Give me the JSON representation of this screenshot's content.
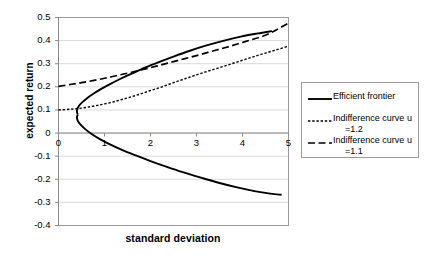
{
  "chart_data": {
    "type": "line",
    "title": "",
    "xlabel": "standard deviation",
    "ylabel": "expected return",
    "xlim": [
      0,
      5
    ],
    "ylim": [
      -0.4,
      0.5
    ],
    "xticks": [
      "0",
      "1",
      "2",
      "3",
      "4",
      "5"
    ],
    "yticks": [
      "0.5",
      "0.4",
      "0.3",
      "0.2",
      "0.1",
      "0",
      "-0.1",
      "-0.2",
      "-0.3",
      "-0.4"
    ],
    "grid": "horizontal",
    "legend_position": "right",
    "series": [
      {
        "name": "Efficient frontier",
        "style": "solid",
        "color": "#000000",
        "width": 1.9,
        "comment": "minimum-variance parabola opening to the right; vertex near (0.4, 0.08)",
        "points": [
          [
            0.42,
            0.08
          ],
          [
            0.4,
            0.092
          ],
          [
            0.41,
            0.104
          ],
          [
            0.45,
            0.119
          ],
          [
            0.52,
            0.134
          ],
          [
            0.62,
            0.151
          ],
          [
            0.75,
            0.169
          ],
          [
            0.92,
            0.19
          ],
          [
            1.12,
            0.212
          ],
          [
            1.35,
            0.235
          ],
          [
            1.6,
            0.258
          ],
          [
            1.88,
            0.283
          ],
          [
            2.18,
            0.307
          ],
          [
            2.5,
            0.331
          ],
          [
            2.84,
            0.355
          ],
          [
            3.2,
            0.378
          ],
          [
            3.58,
            0.399
          ],
          [
            3.96,
            0.417
          ],
          [
            4.3,
            0.43
          ],
          [
            4.52,
            0.437
          ],
          [
            4.64,
            0.441
          ]
        ],
        "lower_branch": [
          [
            0.42,
            0.08
          ],
          [
            0.4,
            0.068
          ],
          [
            0.42,
            0.053
          ],
          [
            0.48,
            0.036
          ],
          [
            0.58,
            0.017
          ],
          [
            0.72,
            -0.004
          ],
          [
            0.9,
            -0.026
          ],
          [
            1.12,
            -0.049
          ],
          [
            1.38,
            -0.073
          ],
          [
            1.68,
            -0.097
          ],
          [
            2.0,
            -0.121
          ],
          [
            2.34,
            -0.145
          ],
          [
            2.7,
            -0.169
          ],
          [
            3.08,
            -0.192
          ],
          [
            3.46,
            -0.214
          ],
          [
            3.86,
            -0.234
          ],
          [
            4.26,
            -0.251
          ],
          [
            4.6,
            -0.262
          ],
          [
            4.85,
            -0.267
          ]
        ]
      },
      {
        "name": "Indifference curve u =1.2",
        "label_line1": "Indifference curve u",
        "label_line2": "=1.2",
        "style": "dotted",
        "color": "#000000",
        "width": 1.4,
        "points": [
          [
            0.0,
            0.1
          ],
          [
            0.25,
            0.103
          ],
          [
            0.5,
            0.108
          ],
          [
            0.75,
            0.116
          ],
          [
            1.0,
            0.126
          ],
          [
            1.25,
            0.138
          ],
          [
            1.5,
            0.152
          ],
          [
            1.75,
            0.167
          ],
          [
            2.0,
            0.184
          ],
          [
            2.25,
            0.2
          ],
          [
            2.5,
            0.218
          ],
          [
            2.75,
            0.235
          ],
          [
            3.0,
            0.252
          ],
          [
            3.25,
            0.268
          ],
          [
            3.5,
            0.283
          ],
          [
            3.75,
            0.299
          ],
          [
            4.0,
            0.315
          ],
          [
            4.25,
            0.331
          ],
          [
            4.5,
            0.346
          ],
          [
            4.75,
            0.361
          ],
          [
            5.0,
            0.376
          ]
        ]
      },
      {
        "name": "Indifference curve u =1.1",
        "label_line1": "Indifference curve u",
        "label_line2": "=1.1",
        "style": "dashed",
        "color": "#000000",
        "width": 1.7,
        "points": [
          [
            0.0,
            0.202
          ],
          [
            0.25,
            0.21
          ],
          [
            0.5,
            0.218
          ],
          [
            0.75,
            0.227
          ],
          [
            1.0,
            0.237
          ],
          [
            1.25,
            0.248
          ],
          [
            1.5,
            0.259
          ],
          [
            1.75,
            0.271
          ],
          [
            2.0,
            0.283
          ],
          [
            2.25,
            0.296
          ],
          [
            2.5,
            0.309
          ],
          [
            2.75,
            0.322
          ],
          [
            3.0,
            0.335
          ],
          [
            3.25,
            0.349
          ],
          [
            3.5,
            0.363
          ],
          [
            3.75,
            0.377
          ],
          [
            4.0,
            0.392
          ],
          [
            4.25,
            0.407
          ],
          [
            4.5,
            0.423
          ],
          [
            4.75,
            0.448
          ],
          [
            5.0,
            0.476
          ]
        ]
      }
    ]
  },
  "axes": {
    "y_title": "expected return",
    "x_title": "standard deviation"
  },
  "legend": {
    "entries": [
      {
        "line1": "Efficient frontier",
        "line2": "",
        "style": "solid"
      },
      {
        "line1": "Indifference curve u",
        "line2": "=1.2",
        "style": "dotted"
      },
      {
        "line1": "Indifference curve u",
        "line2": "=1.1",
        "style": "dashed"
      }
    ]
  },
  "colors": {
    "line": "#000000",
    "grid": "#d9d9d9",
    "axis": "#9a9a9a",
    "background": "#ffffff"
  }
}
